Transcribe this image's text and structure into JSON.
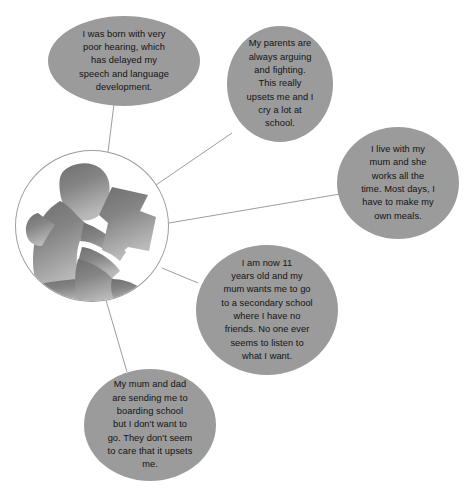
{
  "diagram": {
    "center": {
      "name": "child-reading-silhouette",
      "alt": "Silhouette of a child sitting and reading a book"
    },
    "bubble_fill": "#9b9b9b",
    "text_color": "#131313",
    "line_color": "#9d9d9d",
    "background": "#ffffff",
    "bubbles": [
      {
        "id": "hearing",
        "text": "I was born with very\npoor hearing, which\nhas delayed my\nspeech and language\ndevelopment."
      },
      {
        "id": "parents-arguing",
        "text": "My parents are\nalways arguing\nand fighting.\nThis really\nupsets me and I\ncry a lot at\nschool."
      },
      {
        "id": "mum-works",
        "text": "I live with my\nmum and she\nworks all the\ntime. Most days, I\nhave to make my\nown meals."
      },
      {
        "id": "secondary-school",
        "text": "I am now 11\nyears old and my\nmum wants me to go\nto a secondary school\nwhere I have no\nfriends. No one ever\nseems to listen to\nwhat I want."
      },
      {
        "id": "boarding-school",
        "text": "My mum and dad\nare sending me to\nboarding school\nbut I don't want to\ngo. They don't seem\nto care that it upsets\nme."
      }
    ]
  }
}
